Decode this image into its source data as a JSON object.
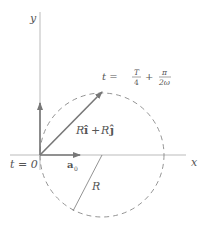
{
  "diagram": {
    "axes": {
      "x_label": "x",
      "y_label": "y"
    },
    "labels": {
      "t_zero": "t = 0",
      "t_label_prefix": "t =",
      "t_frac1_num": "T",
      "t_frac1_den": "4",
      "t_plus": "+",
      "t_frac2_num": "π",
      "t_frac2_den": "2ω",
      "vector_R": "R",
      "vector_i": "î",
      "vector_plus": "+",
      "vector_R2": "R",
      "vector_j": "ĵ",
      "accel_a": "a",
      "accel_sub": "0",
      "radius": "R"
    },
    "colors": {
      "axis": "#999999",
      "vector": "#777777",
      "circle": "#888888",
      "text": "#555555"
    }
  }
}
